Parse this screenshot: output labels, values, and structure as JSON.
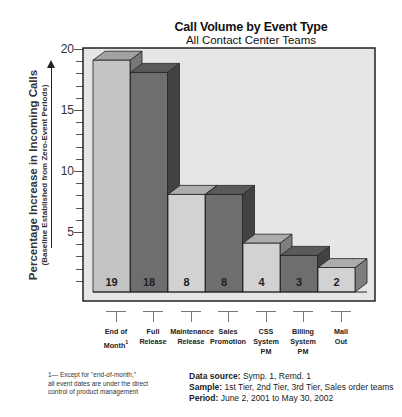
{
  "chart_data": {
    "type": "bar",
    "title": "Call Volume by Event Type",
    "subtitle": "All Contact Center Teams",
    "ylabel": "Percentage Increase in Incoming Calls",
    "ylabel_sub": "(Baseline Established from Zero-Event Periods)",
    "xlabel": "",
    "ylim": [
      0,
      20
    ],
    "yticks": [
      5,
      10,
      15,
      20
    ],
    "grid": false,
    "legend": "none",
    "style": "3d-bar",
    "categories": [
      "End of Month",
      "Full Release",
      "Maintenance Release",
      "Sales Promotion",
      "CSS System PM",
      "Billing System PM",
      "Mail Out"
    ],
    "values": [
      19,
      18,
      8,
      8,
      4,
      3,
      2
    ],
    "data_labels": [
      "19",
      "18",
      "8",
      "8",
      "4",
      "3",
      "2"
    ],
    "bar_colors": [
      "#c4c4c4",
      "#6e6e6e",
      "#d2d2d2",
      "#6e6e6e",
      "#d2d2d2",
      "#6e6e6e",
      "#d2d2d2"
    ],
    "annotations": [
      "1— Except for \"end-of-month,\" all event dates are under the direct control of product management"
    ]
  },
  "header": {
    "title": "Call Volume by Event Type",
    "subtitle": "All Contact Center Teams"
  },
  "axis": {
    "y_main": "Percentage Increase in Incoming Calls",
    "y_sub": "(Baseline Established from Zero-Event Periods)",
    "ticks": [
      "20",
      "15",
      "10",
      "5"
    ]
  },
  "categories": [
    {
      "line1": "End of",
      "line2": "Month",
      "sup": "1",
      "line3": ""
    },
    {
      "line1": "Full",
      "line2": "Release",
      "sup": "",
      "line3": ""
    },
    {
      "line1": "Maintenance",
      "line2": "Release",
      "sup": "",
      "line3": ""
    },
    {
      "line1": "Sales",
      "line2": "Promotion",
      "sup": "",
      "line3": ""
    },
    {
      "line1": "CSS",
      "line2": "System",
      "sup": "",
      "line3": "PM"
    },
    {
      "line1": "Billing",
      "line2": "System",
      "sup": "",
      "line3": "PM"
    },
    {
      "line1": "Mail",
      "line2": "Out",
      "sup": "",
      "line3": ""
    }
  ],
  "footnote": {
    "line1": "1— Except for \"end-of-month,\"",
    "line2": "all event dates are under the direct",
    "line3": "control of product management"
  },
  "meta": {
    "source_label": "Data source:",
    "source_value": "Symp. 1, Remd. 1",
    "sample_label": "Sample:",
    "sample_value": "1st Tier, 2nd Tier, 3rd Tier, Sales order teams",
    "period_label": "Period:",
    "period_value": "June 2, 2001 to May 30, 2002"
  }
}
